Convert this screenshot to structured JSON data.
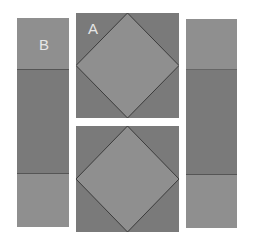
{
  "colors": {
    "background": "#ffffff",
    "light_gray": "#8f8f8f",
    "dark_gray": "#7a7a7a",
    "line": "#3c3c3c",
    "label": "#e6e6e6"
  },
  "diagram": {
    "left_strip": {
      "label": "B",
      "segments": [
        "light",
        "dark",
        "light"
      ]
    },
    "center_blocks": [
      {
        "label": "A",
        "shape": "square-in-a-square"
      },
      {
        "label": "",
        "shape": "square-in-a-square"
      }
    ],
    "right_strip": {
      "label": "",
      "segments": [
        "light",
        "dark",
        "light"
      ]
    }
  }
}
